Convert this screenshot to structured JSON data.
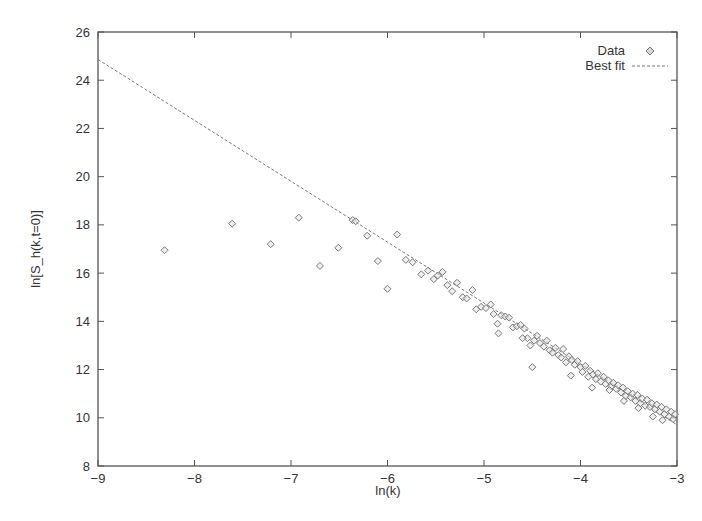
{
  "chart_data": {
    "type": "scatter",
    "title": "",
    "xlabel": "ln(k)",
    "ylabel": "ln[S_h(k,t=0)]",
    "xlim": [
      -9,
      -3
    ],
    "ylim": [
      8,
      26
    ],
    "xticks": [
      -9,
      -8,
      -7,
      -6,
      -5,
      -4,
      -3
    ],
    "yticks": [
      8,
      10,
      12,
      14,
      16,
      18,
      20,
      22,
      24,
      26
    ],
    "grid": false,
    "legend_position": "top-right",
    "series": [
      {
        "name": "Data",
        "style": "diamond markers",
        "points": [
          [
            -8.31,
            16.95
          ],
          [
            -7.61,
            18.05
          ],
          [
            -7.21,
            17.2
          ],
          [
            -6.92,
            18.3
          ],
          [
            -6.7,
            16.3
          ],
          [
            -6.51,
            17.05
          ],
          [
            -6.36,
            18.2
          ],
          [
            -6.33,
            18.15
          ],
          [
            -6.21,
            17.55
          ],
          [
            -6.1,
            16.5
          ],
          [
            -6.0,
            15.35
          ],
          [
            -5.9,
            17.6
          ],
          [
            -5.81,
            16.55
          ],
          [
            -5.74,
            16.45
          ],
          [
            -5.65,
            15.95
          ],
          [
            -5.58,
            16.1
          ],
          [
            -5.52,
            15.75
          ],
          [
            -5.48,
            15.9
          ],
          [
            -5.43,
            16.05
          ],
          [
            -5.38,
            15.5
          ],
          [
            -5.33,
            15.25
          ],
          [
            -5.28,
            15.6
          ],
          [
            -5.22,
            15.0
          ],
          [
            -5.18,
            14.95
          ],
          [
            -5.12,
            15.3
          ],
          [
            -5.08,
            14.5
          ],
          [
            -5.03,
            14.6
          ],
          [
            -4.98,
            14.55
          ],
          [
            -4.93,
            14.7
          ],
          [
            -4.9,
            14.3
          ],
          [
            -4.86,
            13.9
          ],
          [
            -4.82,
            14.25
          ],
          [
            -4.78,
            14.2
          ],
          [
            -4.74,
            14.15
          ],
          [
            -4.7,
            13.75
          ],
          [
            -4.66,
            13.8
          ],
          [
            -4.62,
            13.85
          ],
          [
            -4.58,
            13.7
          ],
          [
            -4.55,
            13.3
          ],
          [
            -4.52,
            13.0
          ],
          [
            -4.48,
            13.2
          ],
          [
            -4.45,
            13.4
          ],
          [
            -4.42,
            13.1
          ],
          [
            -4.38,
            12.95
          ],
          [
            -4.35,
            13.2
          ],
          [
            -4.32,
            12.8
          ],
          [
            -4.29,
            12.7
          ],
          [
            -4.26,
            12.9
          ],
          [
            -4.23,
            12.6
          ],
          [
            -4.2,
            12.5
          ],
          [
            -4.18,
            12.85
          ],
          [
            -4.15,
            12.3
          ],
          [
            -4.12,
            12.55
          ],
          [
            -4.09,
            12.4
          ],
          [
            -4.06,
            12.2
          ],
          [
            -4.03,
            12.35
          ],
          [
            -4.0,
            12.1
          ],
          [
            -3.98,
            11.9
          ],
          [
            -3.95,
            12.15
          ],
          [
            -3.92,
            11.7
          ],
          [
            -3.9,
            11.95
          ],
          [
            -3.87,
            11.8
          ],
          [
            -3.84,
            11.6
          ],
          [
            -3.82,
            11.85
          ],
          [
            -3.79,
            11.5
          ],
          [
            -3.76,
            11.7
          ],
          [
            -3.74,
            11.4
          ],
          [
            -3.71,
            11.55
          ],
          [
            -3.68,
            11.3
          ],
          [
            -3.66,
            11.45
          ],
          [
            -3.63,
            11.2
          ],
          [
            -3.61,
            11.35
          ],
          [
            -3.58,
            11.05
          ],
          [
            -3.56,
            11.25
          ],
          [
            -3.53,
            10.9
          ],
          [
            -3.51,
            11.1
          ],
          [
            -3.48,
            10.85
          ],
          [
            -3.46,
            11.0
          ],
          [
            -3.43,
            10.7
          ],
          [
            -3.41,
            10.95
          ],
          [
            -3.38,
            10.6
          ],
          [
            -3.36,
            10.8
          ],
          [
            -3.33,
            10.5
          ],
          [
            -3.31,
            10.75
          ],
          [
            -3.28,
            10.45
          ],
          [
            -3.26,
            10.6
          ],
          [
            -3.23,
            10.35
          ],
          [
            -3.21,
            10.55
          ],
          [
            -3.18,
            10.25
          ],
          [
            -3.16,
            10.45
          ],
          [
            -3.13,
            10.15
          ],
          [
            -3.11,
            10.35
          ],
          [
            -3.08,
            10.05
          ],
          [
            -3.06,
            10.25
          ],
          [
            -3.04,
            9.95
          ],
          [
            -3.02,
            10.15
          ],
          [
            -4.5,
            12.1
          ],
          [
            -4.1,
            11.75
          ],
          [
            -3.7,
            11.15
          ],
          [
            -3.4,
            10.4
          ],
          [
            -3.15,
            9.9
          ],
          [
            -4.85,
            13.5
          ],
          [
            -4.6,
            13.3
          ],
          [
            -3.88,
            11.25
          ],
          [
            -3.55,
            10.7
          ],
          [
            -3.25,
            10.05
          ]
        ]
      },
      {
        "name": "Best fit",
        "style": "dashed line",
        "slope": -2.525,
        "intercept": 2.13,
        "x_range": [
          -9,
          -3
        ],
        "endpoints": [
          [
            -9,
            24.86
          ],
          [
            -3,
            9.71
          ]
        ]
      }
    ]
  },
  "legend": {
    "data_label": "Data",
    "fit_label": "Best fit"
  },
  "axes": {
    "x_label": "ln(k)",
    "y_label": "ln[S_h(k,t=0)]",
    "x_tick_labels": [
      "−9",
      "−8",
      "−7",
      "−6",
      "−5",
      "−4",
      "−3"
    ],
    "y_tick_labels": [
      "8",
      "10",
      "12",
      "14",
      "16",
      "18",
      "20",
      "22",
      "24",
      "26"
    ]
  },
  "colors": {
    "axis": "#555555",
    "marker": "#777777",
    "line": "#777777",
    "text": "#333333"
  }
}
